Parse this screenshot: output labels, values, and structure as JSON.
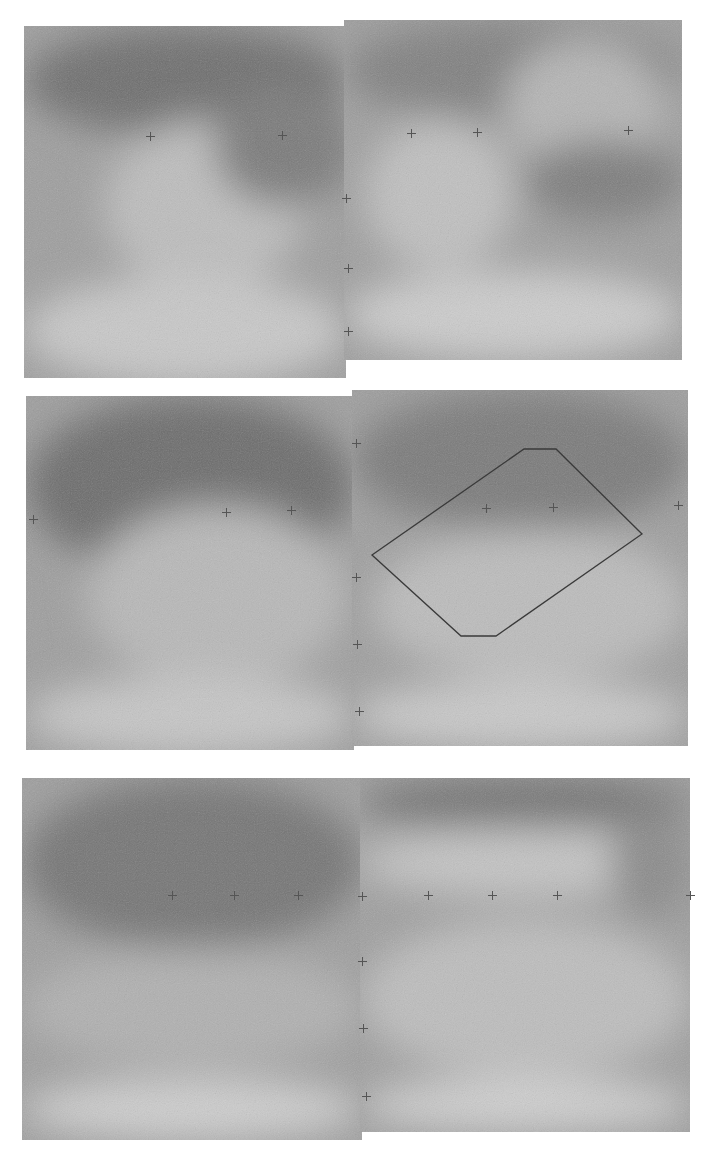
{
  "figure": {
    "panels": [
      {
        "id": "top-left",
        "x": 24,
        "y": 26,
        "w": 322,
        "h": 352
      },
      {
        "id": "top-right",
        "x": 344,
        "y": 20,
        "w": 338,
        "h": 340
      },
      {
        "id": "middle-left",
        "x": 26,
        "y": 396,
        "w": 328,
        "h": 354
      },
      {
        "id": "middle-right",
        "x": 352,
        "y": 390,
        "w": 336,
        "h": 356
      },
      {
        "id": "bottom-left",
        "x": 22,
        "y": 778,
        "w": 340,
        "h": 362
      },
      {
        "id": "bottom-right",
        "x": 360,
        "y": 778,
        "w": 330,
        "h": 354
      }
    ],
    "markers": [
      [
        150,
        136
      ],
      [
        282,
        135
      ],
      [
        346,
        198
      ],
      [
        348,
        268
      ],
      [
        348,
        331
      ],
      [
        411,
        133
      ],
      [
        477,
        132
      ],
      [
        628,
        130
      ],
      [
        33,
        519
      ],
      [
        226,
        512
      ],
      [
        291,
        510
      ],
      [
        356,
        443
      ],
      [
        486,
        508
      ],
      [
        553,
        507
      ],
      [
        678,
        505
      ],
      [
        356,
        577
      ],
      [
        357,
        644
      ],
      [
        359,
        711
      ],
      [
        172,
        895
      ],
      [
        234,
        895
      ],
      [
        298,
        895
      ],
      [
        362,
        896
      ],
      [
        428,
        895
      ],
      [
        492,
        895
      ],
      [
        557,
        895
      ],
      [
        690,
        895
      ],
      [
        362,
        961
      ],
      [
        363,
        1028
      ],
      [
        366,
        1096
      ]
    ],
    "outline_polygon": {
      "points": "372,555 524,449 556,449 642,534 496,636 461,636",
      "color": "#3a3a3a"
    }
  }
}
